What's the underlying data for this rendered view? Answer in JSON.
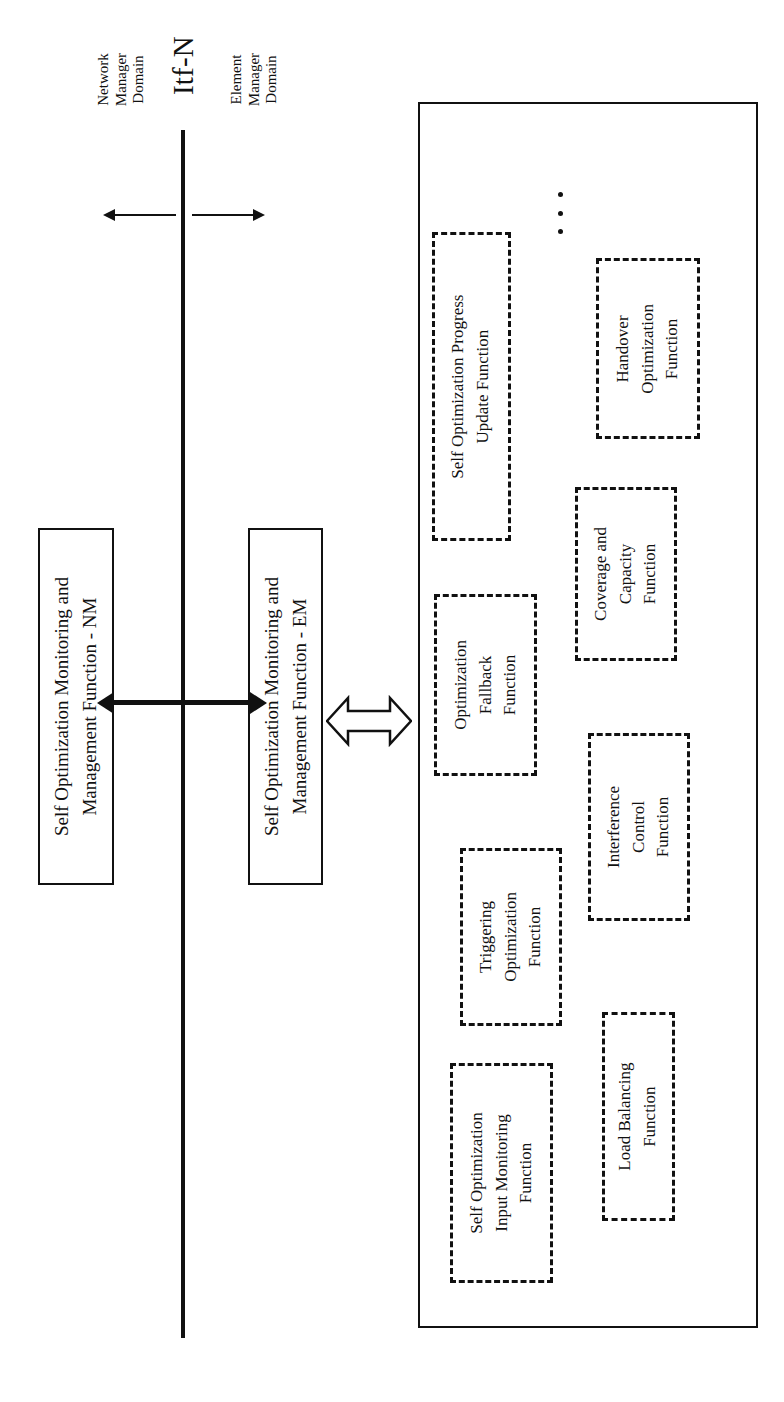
{
  "diagram": {
    "interface_label": "Itf-N",
    "domains": {
      "network_manager": "Network\nManager\nDomain",
      "network_manager_lines": [
        "Network",
        "Manager",
        "Domain"
      ],
      "element_manager_lines": [
        "Element",
        "Manager",
        "Domain"
      ]
    },
    "boxes": {
      "nm_function_lines": [
        "Self Optimization Monitoring and",
        "Management Function - NM"
      ],
      "em_function_lines": [
        "Self Optimization Monitoring and",
        "Management Function - EM"
      ]
    },
    "functions": [
      {
        "id": "self-optimization-progress-update-function",
        "lines": [
          "Self Optimization Progress",
          "Update Function"
        ]
      },
      {
        "id": "handover-optimization-function",
        "lines": [
          "Handover",
          "Optimization",
          "Function"
        ]
      },
      {
        "id": "optimization-fallback-function",
        "lines": [
          "Optimization",
          "Fallback",
          "Function"
        ]
      },
      {
        "id": "coverage-and-capacity-function",
        "lines": [
          "Coverage and",
          "Capacity",
          "Function"
        ]
      },
      {
        "id": "triggering-optimization-function",
        "lines": [
          "Triggering",
          "Optimization",
          "Function"
        ]
      },
      {
        "id": "interference-control-function",
        "lines": [
          "Interference",
          "Control",
          "Function"
        ]
      },
      {
        "id": "self-optimization-input-monitoring-function",
        "lines": [
          "Self Optimization",
          "Input Monitoring",
          "Function"
        ]
      },
      {
        "id": "load-balancing-function",
        "lines": [
          "Load Balancing",
          "Function"
        ]
      }
    ],
    "ellipsis": "⋮",
    "colors": {
      "stroke": "#111111",
      "background": "#ffffff"
    }
  }
}
